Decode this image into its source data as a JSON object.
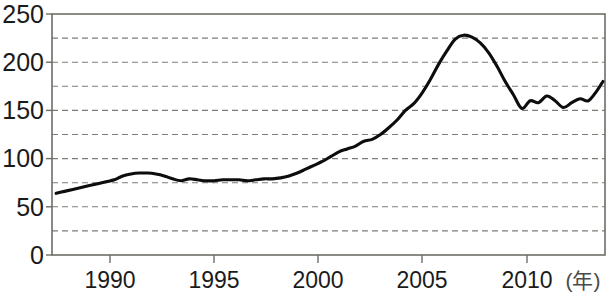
{
  "chart_data": {
    "type": "line",
    "title": "",
    "subtitle": "",
    "xlabel": "(年)",
    "ylabel": "",
    "xlim": [
      1987,
      2013.6
    ],
    "ylim": [
      0,
      250
    ],
    "grid": true,
    "grid_interval": 25,
    "legend": "none",
    "y_ticks": [
      0,
      50,
      100,
      150,
      200,
      250
    ],
    "y_tick_labels": [
      "0",
      "50",
      "100",
      "150",
      "200",
      "250"
    ],
    "x_ticks": [
      1990,
      1995,
      2000,
      2005,
      2010
    ],
    "x_tick_labels": [
      "1990",
      "1995",
      "2000",
      "2005",
      "2010"
    ],
    "x_axis_unit_label": "(年)",
    "series": [
      {
        "name": "value",
        "color": "#0d0d0d",
        "x": [
          1987.2,
          1987.6,
          1988.0,
          1988.4,
          1988.8,
          1989.2,
          1989.6,
          1990.0,
          1990.4,
          1990.8,
          1991.2,
          1991.6,
          1992.0,
          1992.4,
          1992.8,
          1993.2,
          1993.6,
          1994.0,
          1994.4,
          1994.8,
          1995.2,
          1995.6,
          1996.0,
          1996.4,
          1996.8,
          1997.2,
          1997.6,
          1998.0,
          1998.4,
          1998.8,
          1999.2,
          1999.6,
          2000.0,
          2000.4,
          2000.8,
          2001.2,
          2001.6,
          2002.0,
          2002.4,
          2002.8,
          2003.2,
          2003.6,
          2004.0,
          2004.4,
          2004.8,
          2005.2,
          2005.6,
          2006.0,
          2006.4,
          2006.8,
          2007.2,
          2007.6,
          2008.0,
          2008.4,
          2008.8,
          2009.2,
          2009.6,
          2010.0,
          2010.4,
          2010.8,
          2011.2,
          2011.6,
          2012.0,
          2012.4,
          2012.8,
          2013.2,
          2013.5
        ],
        "y": [
          64,
          66,
          68,
          70,
          72,
          74,
          76,
          78,
          82,
          84,
          85,
          85,
          84,
          82,
          79,
          77,
          79,
          78,
          77,
          77,
          78,
          78,
          78,
          77,
          78,
          79,
          79,
          80,
          82,
          85,
          89,
          93,
          97,
          102,
          107,
          110,
          113,
          118,
          120,
          125,
          132,
          140,
          150,
          157,
          168,
          182,
          198,
          212,
          224,
          228,
          226,
          220,
          210,
          196,
          180,
          166,
          152,
          160,
          158,
          165,
          160,
          153,
          158,
          162,
          160,
          170,
          180
        ],
        "min": 64,
        "max": 228,
        "peak_year": 2006.8,
        "peak_value": 228,
        "start_value": 64,
        "end_value": 180
      }
    ],
    "annotations": []
  },
  "axes": {
    "x_unit": "(年)"
  }
}
